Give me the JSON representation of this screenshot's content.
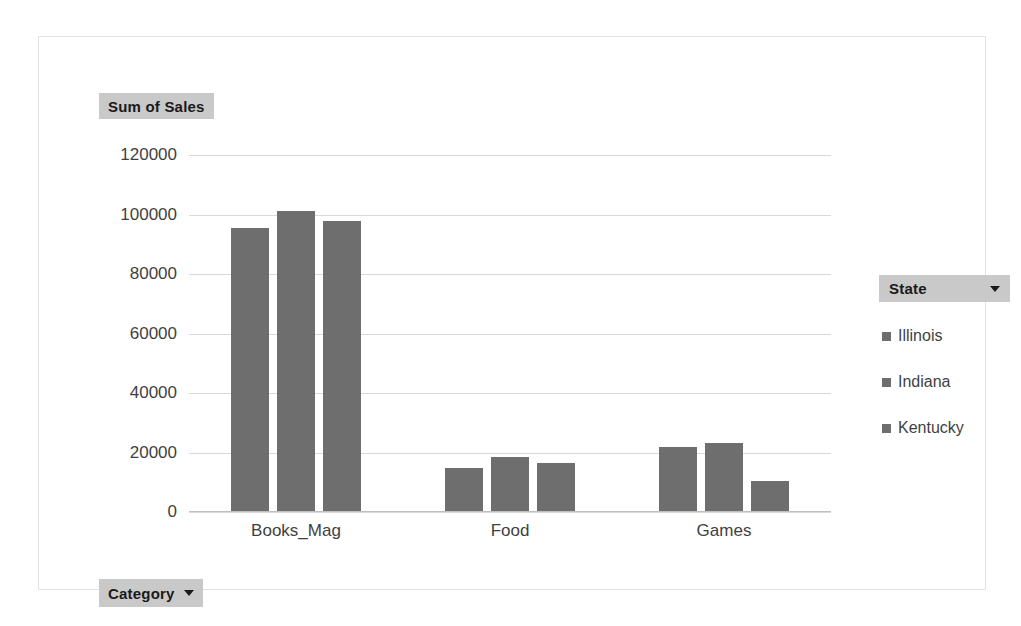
{
  "chart_data": {
    "type": "bar",
    "title": "",
    "value_field_label": "Sum of Sales",
    "category_field_label": "Category",
    "legend_field_label": "State",
    "categories": [
      "Books_Mag",
      "Food",
      "Games"
    ],
    "series": [
      {
        "name": "Illinois",
        "values": [
          95000,
          14500,
          21500
        ]
      },
      {
        "name": "Indiana",
        "values": [
          101000,
          18000,
          23000
        ]
      },
      {
        "name": "Kentucky",
        "values": [
          97500,
          16000,
          10000
        ]
      }
    ],
    "yticks": [
      0,
      20000,
      40000,
      60000,
      80000,
      100000,
      120000
    ],
    "ytick_labels": [
      "0",
      "20000",
      "40000",
      "60000",
      "80000",
      "100000",
      "120000"
    ],
    "ylim": [
      0,
      120000
    ],
    "xlabel": "",
    "ylabel": "",
    "grid": true,
    "legend_position": "right",
    "colors": {
      "bar_fill": "#6e6e6e",
      "gridline": "#d9d9d9",
      "axis_line": "#bfbfbf",
      "field_button_bg": "#c9c9c9",
      "frame_border": "#e2e2e2",
      "tick_text": "#3f3f3f",
      "plot_background": "#ffffff"
    }
  }
}
